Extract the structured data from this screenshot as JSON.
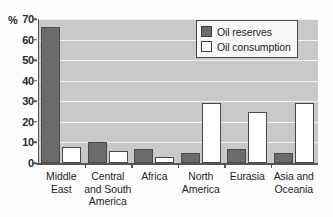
{
  "chart_data": {
    "type": "bar",
    "title": "",
    "subtitle": "",
    "xlabel": "",
    "ylabel": "%",
    "ylim": [
      0,
      70
    ],
    "ytick_step": 10,
    "yticks": [
      70,
      60,
      50,
      40,
      30,
      20,
      10,
      0
    ],
    "grid": true,
    "legend_position": "top-right",
    "categories": [
      "Middle East",
      "Central and South America",
      "Africa",
      "North America",
      "Eurasia",
      "Asia and Oceania"
    ],
    "category_lines": [
      [
        "Middle",
        "East"
      ],
      [
        "Central",
        "and South",
        "America"
      ],
      [
        "Africa"
      ],
      [
        "North",
        "America"
      ],
      [
        "Eurasia"
      ],
      [
        "Asia and",
        "Oceania"
      ]
    ],
    "series": [
      {
        "name": "Oil reserves",
        "color": "#6b6b6b",
        "values": [
          66,
          10,
          7,
          5,
          7,
          5
        ]
      },
      {
        "name": "Oil consumption",
        "color": "#ffffff",
        "values": [
          8,
          6,
          3,
          29,
          25,
          29
        ]
      }
    ]
  },
  "axis": {
    "unit_label": "%"
  },
  "legend": {
    "entries": [
      {
        "label": "Oil reserves",
        "swatch": "reserves"
      },
      {
        "label": "Oil consumption",
        "swatch": "consumption"
      }
    ]
  },
  "colors": {
    "reserves": "#6b6b6b",
    "consumption": "#ffffff",
    "plot_background": "#c9c9c9",
    "gridline": "#f2f2f2",
    "axis": "#555555"
  }
}
